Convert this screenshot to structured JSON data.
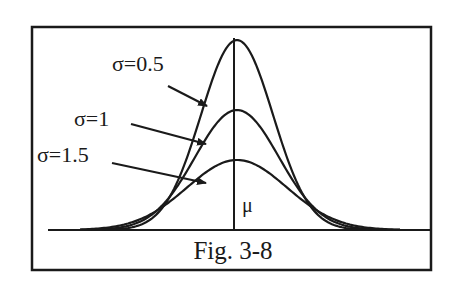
{
  "figure": {
    "caption": "Fig. 3-8",
    "mean_label": "μ",
    "curves": [
      {
        "label": "σ=0.5",
        "sigma": 0.5,
        "peak_y": 40
      },
      {
        "label": "σ=1",
        "sigma": 1,
        "peak_y": 110
      },
      {
        "label": "σ=1.5",
        "sigma": 1.5,
        "peak_y": 160
      }
    ],
    "colors": {
      "ink": "#1a1a1a",
      "background": "#ffffff"
    }
  }
}
